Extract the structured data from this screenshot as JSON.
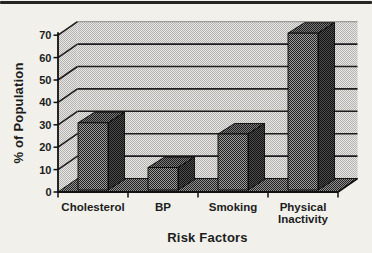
{
  "figure": {
    "top_rule_present": true
  },
  "chart_data": {
    "type": "bar",
    "variant": "3d-column",
    "title": "",
    "xlabel": "Risk Factors",
    "ylabel": "% of Population",
    "categories": [
      "Cholesterol",
      "BP",
      "Smoking",
      "Physical Inactivity"
    ],
    "values": [
      30,
      10,
      25,
      70
    ],
    "ylim": [
      0,
      70
    ],
    "ytick_step": 10,
    "yticks": [
      0,
      10,
      20,
      30,
      40,
      50,
      60,
      70
    ],
    "grid": "horizontal-back-wall",
    "legend": "none",
    "colors": {
      "bar_front": "#5c5c5c",
      "bar_side": "#252525",
      "bar_top": "#444444",
      "wall": "#cbcac7",
      "floor": "#555555",
      "gridline": "#1c1c1c",
      "axis": "#111111",
      "text": "#1c1c1c",
      "rule": "#242424",
      "page_background": "#f1f0eb"
    }
  }
}
